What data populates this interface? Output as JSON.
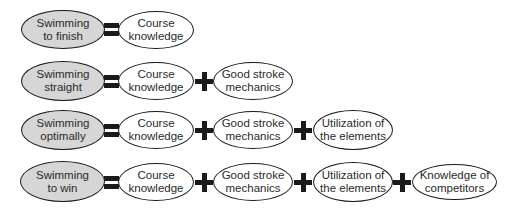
{
  "diagram": {
    "type": "equation-flow",
    "colors": {
      "goal_fill": "#d6d6d6",
      "component_fill": "#ffffff",
      "stroke": "#1a1a1a",
      "text": "#2a2a2a"
    },
    "operators": {
      "equals": "=",
      "plus": "+"
    },
    "rows": [
      {
        "goal": "Swimming\nto finish",
        "components": [
          "Course\nknowledge"
        ]
      },
      {
        "goal": "Swimming\nstraight",
        "components": [
          "Course\nknowledge",
          "Good stroke\nmechanics"
        ]
      },
      {
        "goal": "Swimming\noptimally",
        "components": [
          "Course\nknowledge",
          "Good stroke\nmechanics",
          "Utilization of\nthe elements"
        ]
      },
      {
        "goal": "Swimming\nto win",
        "components": [
          "Course\nknowledge",
          "Good stroke\nmechanics",
          "Utilization of\nthe elements",
          "Knowledge of\ncompetitors"
        ]
      }
    ]
  }
}
